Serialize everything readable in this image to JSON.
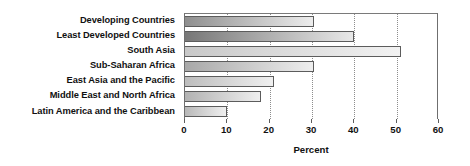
{
  "chart_data": {
    "type": "bar",
    "orientation": "horizontal",
    "title": "",
    "xlabel": "Percent",
    "ylabel": "",
    "xlim": [
      0,
      60
    ],
    "xticks": [
      0,
      10,
      20,
      30,
      40,
      50,
      60
    ],
    "xtick_labels": [
      "0",
      "10",
      "20",
      "30",
      "40",
      "50",
      "60"
    ],
    "grid": true,
    "grid_axis": "x",
    "grid_style": "dotted",
    "legend": null,
    "categories": [
      "Developing Countries",
      "Least Developed Countries",
      "South Asia",
      "Sub-Saharan Africa",
      "East Asia and the Pacific",
      "Middle East and North Africa",
      "Latin America and the Caribbean"
    ],
    "values": [
      30.5,
      40,
      51,
      30.5,
      21,
      18,
      10
    ],
    "bar_colors_left": [
      "#8f8f8f",
      "#777777",
      "#c8c8c8",
      "#a8a8a8",
      "#bdbdbd",
      "#b2b2b2",
      "#b8b8b8"
    ],
    "bar_colors_right": [
      "#ededed",
      "#e8e8e8",
      "#f2f2f2",
      "#eeeeee",
      "#f0f0f0",
      "#efefef",
      "#f0f0f0"
    ],
    "bar_border_color": "#5c5c5c",
    "axis_color": "#6f6f6f",
    "text_color": "#111111",
    "background": "#ffffff"
  }
}
